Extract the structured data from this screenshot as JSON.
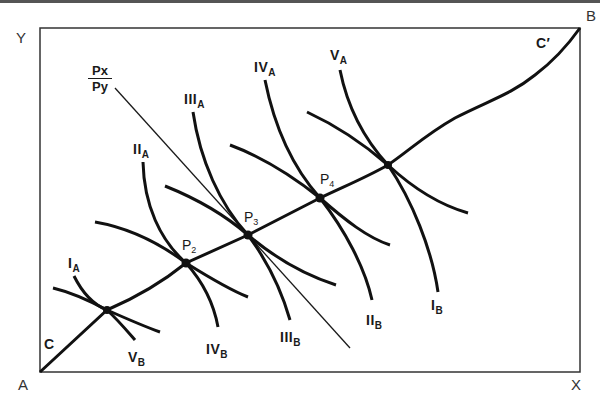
{
  "diagram": {
    "type": "edgeworth-box",
    "corners": {
      "origin_a": "A",
      "origin_b": "B",
      "x_axis": "X",
      "y_axis": "Y"
    },
    "contract_curve": {
      "start_label": "C",
      "end_label": "C′"
    },
    "price_line": {
      "numerator": "Px",
      "denominator": "Py"
    },
    "tangency_points": [
      {
        "label": "P",
        "sub": "2"
      },
      {
        "label": "P",
        "sub": "3"
      },
      {
        "label": "P",
        "sub": "4"
      }
    ],
    "indifference_curves_a": [
      {
        "roman": "I",
        "sub": "A"
      },
      {
        "roman": "II",
        "sub": "A"
      },
      {
        "roman": "III",
        "sub": "A"
      },
      {
        "roman": "IV",
        "sub": "A"
      },
      {
        "roman": "V",
        "sub": "A"
      }
    ],
    "indifference_curves_b": [
      {
        "roman": "I",
        "sub": "B"
      },
      {
        "roman": "II",
        "sub": "B"
      },
      {
        "roman": "III",
        "sub": "B"
      },
      {
        "roman": "IV",
        "sub": "B"
      },
      {
        "roman": "V",
        "sub": "B"
      }
    ],
    "colors": {
      "line": "#1a1a1a",
      "background": "#ffffff"
    }
  }
}
